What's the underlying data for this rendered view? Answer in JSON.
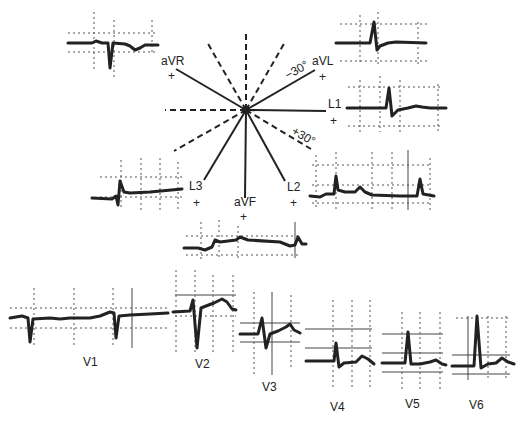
{
  "diagram": {
    "title": "",
    "hexaxial": {
      "leads": [
        {
          "id": "aVR",
          "label": "aVR",
          "polarity": "+"
        },
        {
          "id": "aVL",
          "label": "aVL",
          "polarity": "+"
        },
        {
          "id": "L1",
          "label": "L1",
          "polarity": "+"
        },
        {
          "id": "L2",
          "label": "L2",
          "polarity": "+"
        },
        {
          "id": "aVF",
          "label": "aVF",
          "polarity": "+"
        },
        {
          "id": "L3",
          "label": "L3",
          "polarity": "+"
        }
      ],
      "angles": {
        "minus30": "−30°",
        "plus30": "+30°"
      }
    },
    "limb_tracings": [
      "aVR",
      "aVL",
      "L1",
      "L2",
      "aVF",
      "L3"
    ],
    "precordial": [
      {
        "label": "V1"
      },
      {
        "label": "V2"
      },
      {
        "label": "V3"
      },
      {
        "label": "V4"
      },
      {
        "label": "V5"
      },
      {
        "label": "V6"
      }
    ],
    "colors": {
      "ink": "#222222",
      "grid": "#555555",
      "background": "#ffffff"
    }
  }
}
